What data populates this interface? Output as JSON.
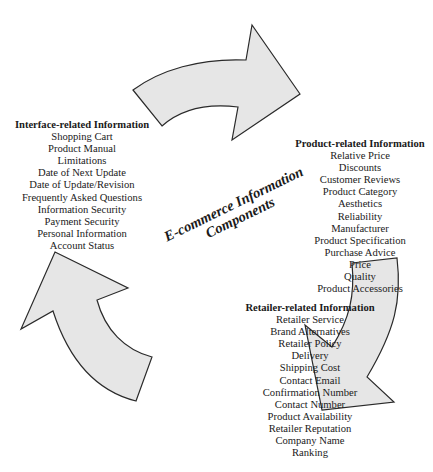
{
  "diagram": {
    "center_title": {
      "line1": "E-commerce Information",
      "line2": "Components"
    },
    "groups": {
      "interface": {
        "title": "Interface-related Information",
        "items": [
          "Shopping Cart",
          "Product Manual",
          "Limitations",
          "Date of Next Update",
          "Date of Update/Revision",
          "Frequently Asked Questions",
          "Information Security",
          "Payment Security",
          "Personal Information",
          "Account Status"
        ]
      },
      "product": {
        "title": "Product-related Information",
        "items": [
          "Relative Price",
          "Discounts",
          "Customer Reviews",
          "Product Category",
          "Aesthetics",
          "Reliability",
          "Manufacturer",
          "Product Specification",
          "Purchase Advice",
          "Price",
          "Quality",
          "Product Accessories"
        ]
      },
      "retailer": {
        "title": "Retailer-related Information",
        "items": [
          "Retailer Service",
          "Brand Alternatives",
          "Retailer Policy",
          "Delivery",
          "Shipping Cost",
          "Contact Email",
          "Confirmation Number",
          "Contact Number",
          "Product Availability",
          "Retailer Reputation",
          "Company Name",
          "Ranking"
        ]
      }
    },
    "arrows": [
      {
        "name": "interface-to-product",
        "direction": "right"
      },
      {
        "name": "product-to-retailer",
        "direction": "down-left"
      },
      {
        "name": "retailer-to-interface",
        "direction": "up"
      }
    ],
    "colors": {
      "arrow_fill": "#e6e6e6",
      "arrow_stroke": "#2a2a2a",
      "text": "#1a1a1a"
    }
  }
}
